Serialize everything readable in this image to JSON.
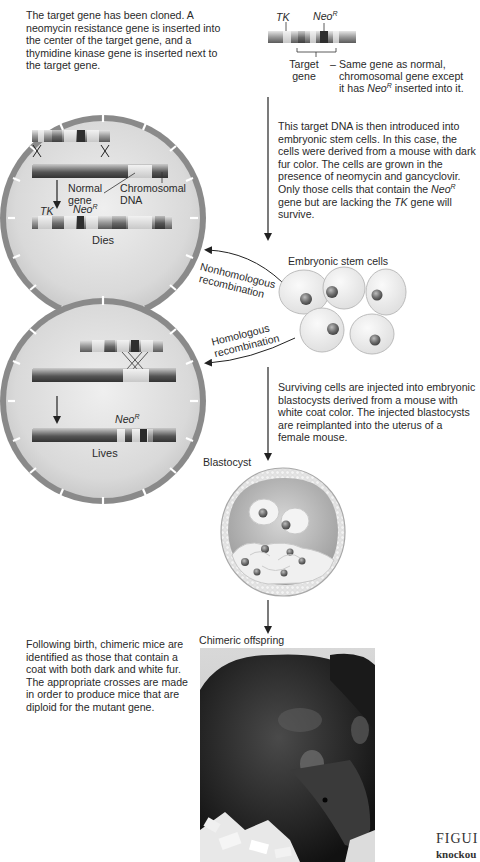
{
  "figure": {
    "intro_text": "The target gene has been cloned. A neomycin resistance gene is inserted into the center of the target gene, and a thymidine kinase gene is inserted next to the target gene.",
    "construct": {
      "tk_label": "TK",
      "neo_label": "Neo",
      "neo_sup": "R",
      "target_label_line1": "Target",
      "target_label_line2": "gene",
      "dash": "–",
      "description_line1": "Same gene as normal,",
      "description_line2": "chromosomal gene except",
      "description_line3_pre": "it has ",
      "description_line3_neo": "Neo",
      "description_line3_sup": "R",
      "description_line3_post": " inserted into it."
    },
    "step2_text": {
      "line1": "This target DNA is then introduced into",
      "line2": "embryonic stem cells. In this case, the",
      "line3": "cells were derived from a mouse with dark",
      "line4": "fur color. The cells are grown in the",
      "line5": "presence of neomycin and gancyclovir.",
      "line6_pre": "Only those cells that contain the ",
      "line6_neo": "Neo",
      "line6_sup": "R",
      "line7_pre": "gene but are lacking the ",
      "line7_tk": "TK",
      "line7_post": " gene will",
      "line8": "survive."
    },
    "nonhomologous_cell": {
      "normal_gene_line1": "Normal",
      "normal_gene_line2": "gene",
      "chromosomal_line1": "Chromosomal",
      "chromosomal_line2": "DNA",
      "tk_label": "TK",
      "neo_label": "Neo",
      "neo_sup": "R",
      "outcome": "Dies"
    },
    "homologous_cell": {
      "neo_label": "Neo",
      "neo_sup": "R",
      "outcome": "Lives"
    },
    "stem_cells_label": "Embryonic stem cells",
    "nonhomologous_label_line1": "Nonhomologous",
    "nonhomologous_label_line2": "recombination",
    "homologous_label_line1": "Homologous",
    "homologous_label_line2": "recombination",
    "step3_text": {
      "line1": "Surviving cells are injected into embryonic",
      "line2": "blastocysts derived from a mouse with",
      "line3": "white coat color. The injected blastocysts",
      "line4": "are reimplanted into the uterus of a",
      "line5": "female mouse."
    },
    "blastocyst_label": "Blastocyst",
    "step4_text": {
      "line1": "Following birth, chimeric mice are",
      "line2": "identified as those that contain a",
      "line3": "coat with both dark and white fur.",
      "line4": "The appropriate crosses are made",
      "line5": "in order to produce mice that are",
      "line6": "diploid for the mutant gene."
    },
    "offspring_label": "Chimeric offspring",
    "caption_partial_line1": "FIGUI",
    "caption_partial_line2": "knockou"
  },
  "colors": {
    "cell_fill": "#dcdcdc",
    "cell_wall": "#8a8a8a",
    "dna_dark": "#4a4a4a",
    "stem_cell_fill": "#ececec",
    "arrow": "#222222"
  }
}
